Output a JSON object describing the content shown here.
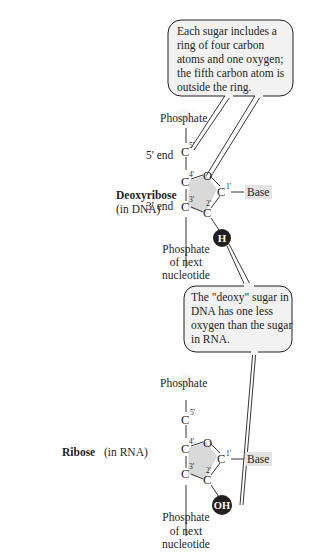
{
  "callouts": {
    "ring_note": {
      "lines": [
        "Each sugar includes a",
        "ring of four carbon",
        "atoms and one oxygen;",
        "the fifth carbon atom is",
        "outside the ring."
      ]
    },
    "deoxy_note": {
      "lines": [
        "The \"deoxy\" sugar in",
        "DNA has one less",
        "oxygen than the sugar",
        "in RNA."
      ]
    }
  },
  "deoxyribose": {
    "title": "Deoxyribose",
    "subtitle": "(in DNA)",
    "phosphate_top": "Phosphate",
    "five_end": "5' end",
    "three_end": "3' end",
    "atoms": {
      "c5": "C",
      "c4": "C",
      "o": "O",
      "c1": "C",
      "c2": "C",
      "c3": "C"
    },
    "primes": {
      "c5": "5'",
      "c4": "4'",
      "c1": "1'",
      "c2": "2'",
      "c3": "3'"
    },
    "base": "Base",
    "substituent": "H",
    "phosphate_bottom": [
      "Phosphate",
      "of next",
      "nucleotide"
    ]
  },
  "ribose": {
    "title": "Ribose",
    "subtitle": "(in RNA)",
    "phosphate_top": "Phosphate",
    "atoms": {
      "c5": "C",
      "c4": "C",
      "o": "O",
      "c1": "C",
      "c2": "C",
      "c3": "C"
    },
    "primes": {
      "c5": "5'",
      "c4": "4'",
      "c1": "1'",
      "c2": "2'",
      "c3": "3'"
    },
    "base": "Base",
    "substituent": "OH",
    "phosphate_bottom": [
      "Phosphate",
      "of next",
      "nucleotide"
    ]
  },
  "colors": {
    "ring_fill": "#d9d9d9",
    "base_fill": "#e3e3e3",
    "substituent_fill": "#231f20",
    "callout_fill": "#f2f2f2",
    "line": "#231f20"
  }
}
